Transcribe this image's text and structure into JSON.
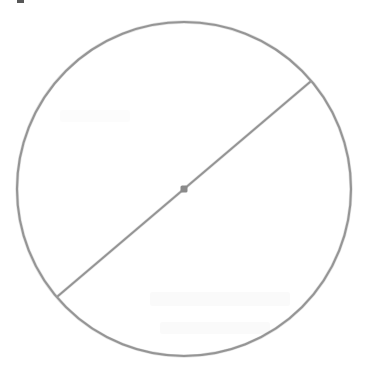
{
  "figure": {
    "background_color": "#ffffff",
    "width": 366,
    "height": 378,
    "stroke_color": "#8a8a8a",
    "center_dot_color": "#8a8a8a",
    "circle": {
      "label": "circle outline",
      "center_x": 184,
      "center_y": 189,
      "radius": 167,
      "stroke_width": 2.1
    },
    "center_point": {
      "label": "center point",
      "x": 184,
      "y": 189,
      "size": 7
    },
    "diameter": {
      "label": "diameter segment",
      "x1": 58,
      "y1": 296,
      "x2": 310,
      "y2": 82,
      "stroke_width": 2.0
    },
    "artifacts": {
      "top_left_mark": "cropped glyph fragment",
      "bleed_through": "faint show-through text"
    }
  }
}
